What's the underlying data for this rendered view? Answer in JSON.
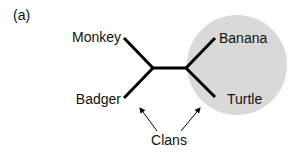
{
  "figure": {
    "panel_label": "(a)",
    "tree": {
      "leaves": [
        {
          "name": "Monkey"
        },
        {
          "name": "Badger"
        },
        {
          "name": "Banana"
        },
        {
          "name": "Turtle"
        }
      ]
    },
    "clan_highlight_color": "#d9d9d9",
    "annotation": "Clans"
  }
}
